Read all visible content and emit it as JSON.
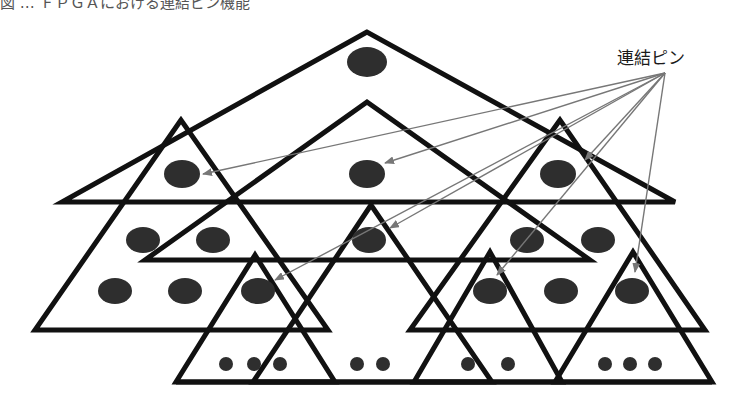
{
  "diagram": {
    "title_partial": "図 … ＦＰＧＡにおける連結ピン機能",
    "pin_label": "連結ピン",
    "colors": {
      "stroke": "#111111",
      "node_fill": "#2e2e2e",
      "arrow": "#777777",
      "background": "#ffffff"
    },
    "pin_source": [
      665,
      73
    ],
    "levels": [
      {
        "level": 1,
        "triangles": [
          {
            "id": "top",
            "apex": [
              367,
              32
            ],
            "base_left": [
              62,
              202
            ],
            "base_right": [
              675,
              202
            ]
          }
        ]
      },
      {
        "level": 2,
        "triangles": [
          {
            "id": "left",
            "apex": [
              181,
              120
            ],
            "base_left": [
              35,
              330
            ],
            "base_right": [
              328,
              330
            ]
          },
          {
            "id": "center",
            "apex": [
              367,
              102
            ],
            "base_left": [
              145,
              260
            ],
            "base_right": [
              590,
              260
            ]
          },
          {
            "id": "right",
            "apex": [
              560,
              120
            ],
            "base_left": [
              410,
              330
            ],
            "base_right": [
              705,
              330
            ]
          }
        ]
      },
      {
        "level": 3,
        "triangles": [
          {
            "id": "b1",
            "apex": [
              255,
              255
            ],
            "base_left": [
              176,
              382
            ],
            "base_right": [
              335,
              382
            ]
          },
          {
            "id": "b2",
            "apex": [
              371,
              205
            ],
            "base_left": [
              253,
              382
            ],
            "base_right": [
              492,
              382
            ]
          },
          {
            "id": "b3",
            "apex": [
              490,
              252
            ],
            "base_left": [
              414,
              382
            ],
            "base_right": [
              562,
              382
            ]
          },
          {
            "id": "b4",
            "apex": [
              633,
              252
            ],
            "base_left": [
              555,
              382
            ],
            "base_right": [
              712,
              382
            ]
          }
        ]
      }
    ],
    "base_lines": [
      {
        "y": 382,
        "x1": 176,
        "x2": 712
      }
    ],
    "large_nodes": [
      {
        "cx": 367,
        "cy": 62,
        "rx": 20,
        "ry": 15
      },
      {
        "cx": 182,
        "cy": 174,
        "rx": 18,
        "ry": 14
      },
      {
        "cx": 367,
        "cy": 174,
        "rx": 18,
        "ry": 14
      },
      {
        "cx": 558,
        "cy": 174,
        "rx": 18,
        "ry": 14
      },
      {
        "cx": 143,
        "cy": 240,
        "rx": 17,
        "ry": 13
      },
      {
        "cx": 213,
        "cy": 240,
        "rx": 17,
        "ry": 13
      },
      {
        "cx": 527,
        "cy": 240,
        "rx": 17,
        "ry": 13
      },
      {
        "cx": 598,
        "cy": 240,
        "rx": 17,
        "ry": 13
      },
      {
        "cx": 369,
        "cy": 240,
        "rx": 17,
        "ry": 13
      },
      {
        "cx": 115,
        "cy": 291,
        "rx": 17,
        "ry": 13
      },
      {
        "cx": 185,
        "cy": 291,
        "rx": 17,
        "ry": 13
      },
      {
        "cx": 258,
        "cy": 291,
        "rx": 17,
        "ry": 13
      },
      {
        "cx": 490,
        "cy": 291,
        "rx": 17,
        "ry": 13
      },
      {
        "cx": 561,
        "cy": 291,
        "rx": 17,
        "ry": 13
      },
      {
        "cx": 632,
        "cy": 291,
        "rx": 17,
        "ry": 13
      }
    ],
    "small_nodes": [
      {
        "cx": 226,
        "cy": 364,
        "r": 7
      },
      {
        "cx": 254,
        "cy": 364,
        "r": 7
      },
      {
        "cx": 280,
        "cy": 364,
        "r": 7
      },
      {
        "cx": 357,
        "cy": 364,
        "r": 7
      },
      {
        "cx": 383,
        "cy": 364,
        "r": 7
      },
      {
        "cx": 468,
        "cy": 364,
        "r": 7
      },
      {
        "cx": 508,
        "cy": 364,
        "r": 7
      },
      {
        "cx": 605,
        "cy": 364,
        "r": 7
      },
      {
        "cx": 630,
        "cy": 364,
        "r": 7
      },
      {
        "cx": 655,
        "cy": 364,
        "r": 7
      }
    ],
    "pin_arrows": [
      {
        "target": [
          203,
          174
        ]
      },
      {
        "target": [
          385,
          163
        ]
      },
      {
        "target": [
          585,
          160
        ]
      },
      {
        "target": [
          390,
          228
        ]
      },
      {
        "target": [
          275,
          280
        ]
      },
      {
        "target": [
          497,
          275
        ]
      },
      {
        "target": [
          635,
          272
        ]
      }
    ]
  }
}
